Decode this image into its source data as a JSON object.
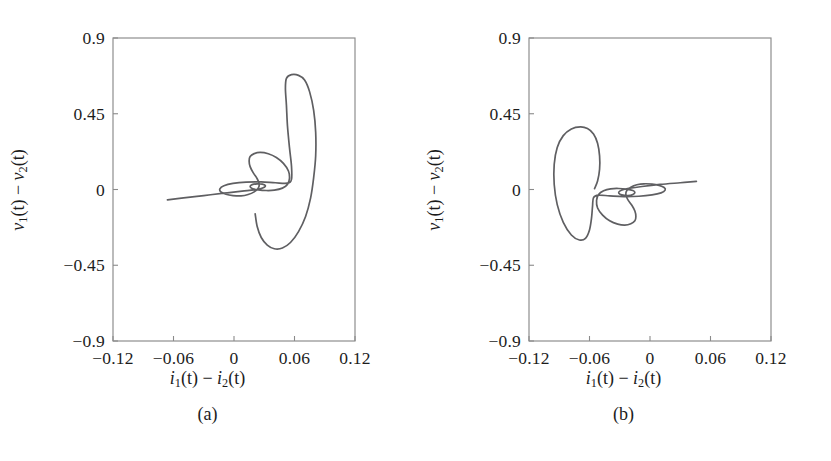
{
  "figure": {
    "background": "#ffffff",
    "curve_color": "#5f5f62",
    "axis_color": "#8a8a8a",
    "grid_color": "#e8e8ea"
  },
  "panels": [
    {
      "id": "a",
      "caption": "(a)",
      "xlabel_parts": {
        "v1": "i",
        "sub1": "1",
        "mid": "(t) − ",
        "v2": "i",
        "sub2": "2",
        "end": "(t)"
      },
      "ylabel_parts": {
        "v1": "v",
        "sub1": "1",
        "mid": "(t) − ",
        "v2": "v",
        "sub2": "2",
        "end": "(t)"
      },
      "xticks": [
        "−0.12",
        "−0.06",
        "0",
        "0.06",
        "0.12"
      ],
      "xtick_values": [
        -0.12,
        -0.06,
        0,
        0.06,
        0.12
      ],
      "yticks": [
        "0.9",
        "0.45",
        "0",
        "−0.45",
        "−0.9"
      ],
      "ytick_values": [
        0.9,
        0.45,
        0,
        -0.45,
        -0.9
      ],
      "xlim": [
        -0.12,
        0.12
      ],
      "ylim": [
        -0.9,
        0.9
      ]
    },
    {
      "id": "b",
      "caption": "(b)",
      "xlabel_parts": {
        "v1": "i",
        "sub1": "1",
        "mid": "(t) − ",
        "v2": "i",
        "sub2": "2",
        "end": "(t)"
      },
      "ylabel_parts": {
        "v1": "v",
        "sub1": "1",
        "mid": "(t) − ",
        "v2": "v",
        "sub2": "2",
        "end": "(t)"
      },
      "xticks": [
        "−0.12",
        "−0.06",
        "0",
        "0.06",
        "0.12"
      ],
      "xtick_values": [
        -0.12,
        -0.06,
        0,
        0.06,
        0.12
      ],
      "yticks": [
        "0.9",
        "0.45",
        "0",
        "−0.45",
        "−0.9"
      ],
      "ytick_values": [
        0.9,
        0.45,
        0,
        -0.45,
        -0.9
      ],
      "xlim": [
        -0.12,
        0.12
      ],
      "ylim": [
        -0.9,
        0.9
      ]
    }
  ],
  "chart_data": [
    {
      "type": "line",
      "panel": "a",
      "title": "",
      "xlabel": "i_1(t) - i_2(t)",
      "ylabel": "v_1(t) - v_2(t)",
      "xlim": [
        -0.12,
        0.12
      ],
      "ylim": [
        -0.9,
        0.9
      ],
      "xticks": [
        -0.12,
        -0.06,
        0,
        0.06,
        0.12
      ],
      "yticks": [
        -0.9,
        -0.45,
        0,
        0.45,
        0.9
      ],
      "grid": true,
      "legend": "none",
      "series": [
        {
          "name": "trajectory-a",
          "description": "Outward spiraling phase trajectory: begins at a far-left thin lobe tip, sweeps inward to a tight central loop, then expands clockwise into a large right-hand loop with a tall upper peak.",
          "points": [
            [
              -0.066,
              -0.062
            ],
            [
              -0.05,
              -0.05
            ],
            [
              -0.03,
              -0.036
            ],
            [
              -0.01,
              -0.022
            ],
            [
              0.008,
              -0.01
            ],
            [
              0.02,
              -0.002
            ],
            [
              0.026,
              0.004
            ],
            [
              0.03,
              0.013
            ],
            [
              0.031,
              0.024
            ],
            [
              0.028,
              0.032
            ],
            [
              0.023,
              0.034
            ],
            [
              0.018,
              0.029
            ],
            [
              0.016,
              0.018
            ],
            [
              0.018,
              0.006
            ],
            [
              0.024,
              -0.002
            ],
            [
              0.032,
              -0.006
            ],
            [
              0.04,
              -0.004
            ],
            [
              0.048,
              0.008
            ],
            [
              0.053,
              0.03
            ],
            [
              0.055,
              0.065
            ],
            [
              0.054,
              0.11
            ],
            [
              0.049,
              0.155
            ],
            [
              0.042,
              0.19
            ],
            [
              0.034,
              0.212
            ],
            [
              0.026,
              0.22
            ],
            [
              0.02,
              0.213
            ],
            [
              0.016,
              0.196
            ],
            [
              0.015,
              0.17
            ],
            [
              0.016,
              0.136
            ],
            [
              0.019,
              0.1
            ],
            [
              0.023,
              0.064
            ],
            [
              0.025,
              0.033
            ],
            [
              0.024,
              0.008
            ],
            [
              0.02,
              -0.014
            ],
            [
              0.014,
              -0.03
            ],
            [
              0.007,
              -0.038
            ],
            [
              -0.001,
              -0.036
            ],
            [
              -0.008,
              -0.028
            ],
            [
              -0.013,
              -0.014
            ],
            [
              -0.014,
              0.004
            ],
            [
              -0.01,
              0.022
            ],
            [
              -0.001,
              0.036
            ],
            [
              0.012,
              0.044
            ],
            [
              0.027,
              0.045
            ],
            [
              0.041,
              0.04
            ],
            [
              0.053,
              0.038
            ],
            [
              0.057,
              0.06
            ],
            [
              0.057,
              0.14
            ],
            [
              0.055,
              0.25
            ],
            [
              0.053,
              0.38
            ],
            [
              0.052,
              0.5
            ],
            [
              0.051,
              0.6
            ],
            [
              0.052,
              0.66
            ],
            [
              0.057,
              0.682
            ],
            [
              0.064,
              0.678
            ],
            [
              0.07,
              0.65
            ],
            [
              0.075,
              0.58
            ],
            [
              0.079,
              0.47
            ],
            [
              0.081,
              0.34
            ],
            [
              0.081,
              0.2
            ],
            [
              0.079,
              0.07
            ],
            [
              0.076,
              -0.05
            ],
            [
              0.071,
              -0.16
            ],
            [
              0.064,
              -0.25
            ],
            [
              0.056,
              -0.315
            ],
            [
              0.048,
              -0.348
            ],
            [
              0.04,
              -0.352
            ],
            [
              0.033,
              -0.33
            ],
            [
              0.027,
              -0.285
            ],
            [
              0.023,
              -0.22
            ],
            [
              0.021,
              -0.145
            ]
          ]
        }
      ]
    },
    {
      "type": "line",
      "panel": "b",
      "title": "",
      "xlabel": "i_1(t) - i_2(t)",
      "ylabel": "v_1(t) - v_2(t)",
      "xlim": [
        -0.12,
        0.12
      ],
      "ylim": [
        -0.9,
        0.9
      ],
      "xticks": [
        -0.12,
        -0.06,
        0,
        0.06,
        0.12
      ],
      "yticks": [
        -0.9,
        -0.45,
        0,
        0.45,
        0.9
      ],
      "grid": true,
      "legend": "none",
      "series": [
        {
          "name": "trajectory-b",
          "description": "Mirror-image outward spiraling trajectory: begins at a far-right thin lobe tip, sweeps inward to a tight central loop, then expands counter-clockwise into a large left-hand loop that ends in a downward hook.",
          "points": [
            [
              0.046,
              0.048
            ],
            [
              0.03,
              0.04
            ],
            [
              0.01,
              0.03
            ],
            [
              -0.008,
              0.018
            ],
            [
              -0.02,
              0.008
            ],
            [
              -0.026,
              0.0
            ],
            [
              -0.03,
              -0.01
            ],
            [
              -0.031,
              -0.022
            ],
            [
              -0.028,
              -0.032
            ],
            [
              -0.022,
              -0.036
            ],
            [
              -0.017,
              -0.03
            ],
            [
              -0.015,
              -0.018
            ],
            [
              -0.017,
              -0.006
            ],
            [
              -0.023,
              0.002
            ],
            [
              -0.031,
              0.006
            ],
            [
              -0.039,
              0.004
            ],
            [
              -0.046,
              -0.008
            ],
            [
              -0.051,
              -0.03
            ],
            [
              -0.053,
              -0.065
            ],
            [
              -0.052,
              -0.11
            ],
            [
              -0.047,
              -0.152
            ],
            [
              -0.04,
              -0.186
            ],
            [
              -0.032,
              -0.206
            ],
            [
              -0.025,
              -0.212
            ],
            [
              -0.019,
              -0.204
            ],
            [
              -0.015,
              -0.186
            ],
            [
              -0.014,
              -0.16
            ],
            [
              -0.015,
              -0.128
            ],
            [
              -0.018,
              -0.094
            ],
            [
              -0.022,
              -0.06
            ],
            [
              -0.024,
              -0.03
            ],
            [
              -0.023,
              -0.006
            ],
            [
              -0.019,
              0.014
            ],
            [
              -0.013,
              0.028
            ],
            [
              -0.006,
              0.034
            ],
            [
              0.002,
              0.032
            ],
            [
              0.009,
              0.024
            ],
            [
              0.014,
              0.012
            ],
            [
              0.015,
              -0.004
            ],
            [
              0.011,
              -0.02
            ],
            [
              0.002,
              -0.032
            ],
            [
              -0.011,
              -0.04
            ],
            [
              -0.026,
              -0.042
            ],
            [
              -0.04,
              -0.038
            ],
            [
              -0.051,
              -0.034
            ],
            [
              -0.056,
              -0.048
            ],
            [
              -0.057,
              -0.1
            ],
            [
              -0.058,
              -0.17
            ],
            [
              -0.06,
              -0.24
            ],
            [
              -0.064,
              -0.29
            ],
            [
              -0.07,
              -0.3
            ],
            [
              -0.078,
              -0.27
            ],
            [
              -0.086,
              -0.195
            ],
            [
              -0.092,
              -0.09
            ],
            [
              -0.095,
              0.03
            ],
            [
              -0.095,
              0.15
            ],
            [
              -0.092,
              0.25
            ],
            [
              -0.086,
              0.32
            ],
            [
              -0.078,
              0.36
            ],
            [
              -0.069,
              0.372
            ],
            [
              -0.062,
              0.362
            ],
            [
              -0.056,
              0.33
            ],
            [
              -0.052,
              0.275
            ],
            [
              -0.05,
              0.2
            ],
            [
              -0.05,
              0.12
            ],
            [
              -0.052,
              0.05
            ],
            [
              -0.055,
              0.005
            ]
          ]
        }
      ]
    }
  ]
}
